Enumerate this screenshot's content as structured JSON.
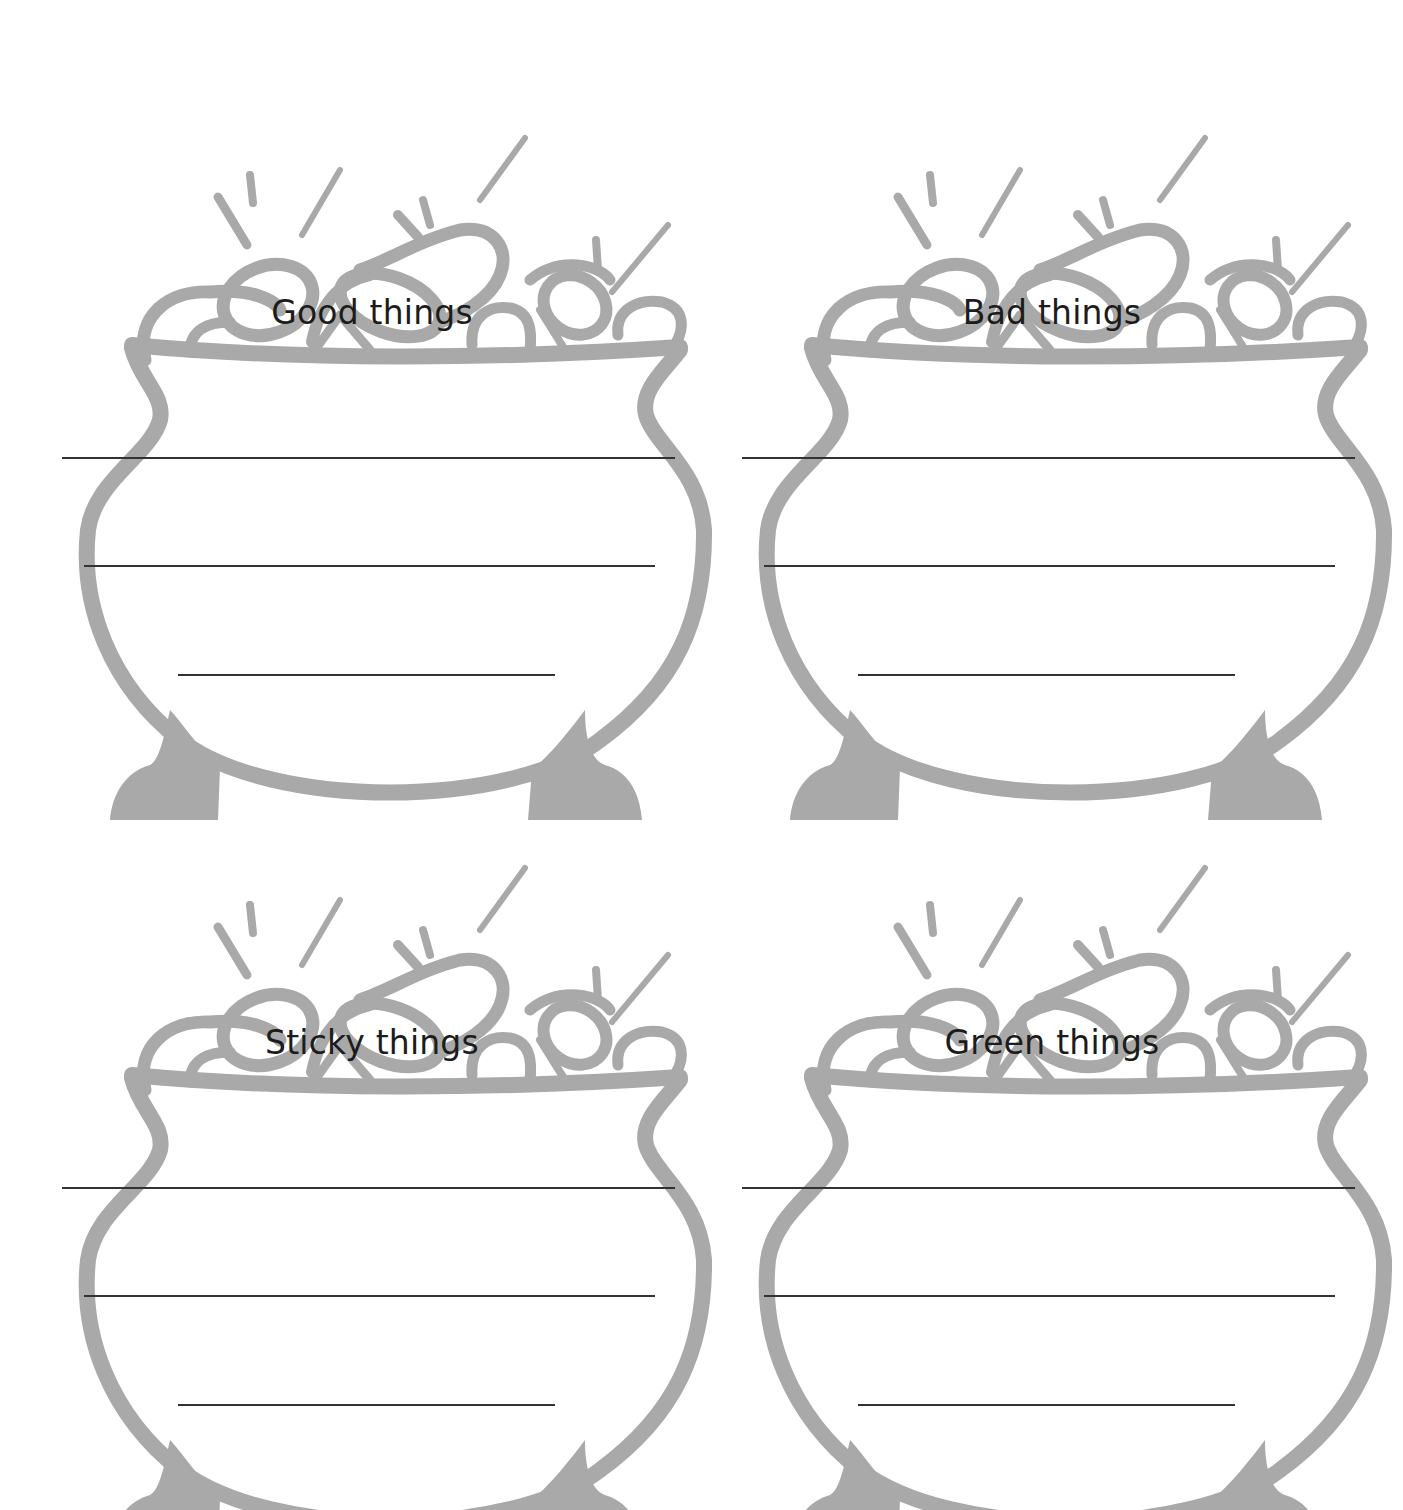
{
  "page": {
    "background": "#ffffff",
    "pot_color": "#a9a9a9",
    "line_color": "#333333",
    "top_text_fragment": "…g  …g  … p"
  },
  "pots": [
    {
      "label": "Good things",
      "x": 40,
      "y": 60,
      "lines": 3
    },
    {
      "label": "Bad things",
      "x": 720,
      "y": 60,
      "lines": 3
    },
    {
      "label": "Sticky things",
      "x": 40,
      "y": 790,
      "lines": 3
    },
    {
      "label": "Green things",
      "x": 720,
      "y": 790,
      "lines": 3
    }
  ]
}
